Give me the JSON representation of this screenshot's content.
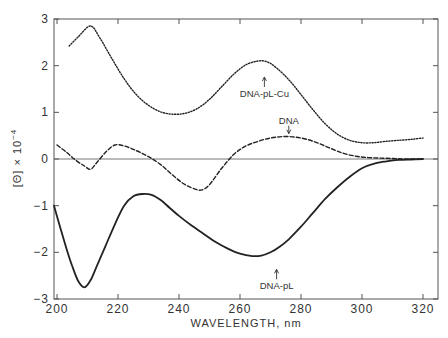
{
  "chart_data": {
    "type": "line",
    "title": "",
    "xlabel": "WAVELENGTH, nm",
    "ylabel": "[Θ] × 10",
    "ylabel_exponent": "−4",
    "xlim": [
      199,
      325
    ],
    "ylim": [
      -3,
      3
    ],
    "x_ticks": [
      200,
      220,
      240,
      260,
      280,
      300,
      320
    ],
    "x_tick_labels": [
      "200",
      "220",
      "240",
      "260",
      "280",
      "300",
      "320"
    ],
    "y_ticks": [
      3,
      2,
      1,
      0,
      -1,
      -2,
      -3
    ],
    "y_tick_labels": [
      "3",
      "2",
      "1",
      "0",
      "−1",
      "−2",
      "−3"
    ],
    "grid": false,
    "zero_line": true,
    "legend": "inline labels",
    "series": [
      {
        "name": "DNA-pL-Cu",
        "style": "dotted",
        "x": [
          204,
          207,
          211,
          214,
          218,
          222,
          226,
          230,
          234,
          238,
          242,
          246,
          250,
          254,
          258,
          262,
          266,
          269,
          272,
          276,
          280,
          284,
          288,
          292,
          296,
          300,
          304,
          308,
          312,
          316,
          320
        ],
        "values": [
          2.42,
          2.62,
          2.85,
          2.6,
          2.15,
          1.72,
          1.38,
          1.15,
          1.01,
          0.96,
          0.98,
          1.08,
          1.28,
          1.55,
          1.82,
          2.02,
          2.1,
          2.08,
          1.95,
          1.7,
          1.38,
          1.05,
          0.75,
          0.53,
          0.4,
          0.35,
          0.35,
          0.38,
          0.4,
          0.42,
          0.45
        ],
        "label_pos": {
          "nm": 268,
          "value": 1.8
        }
      },
      {
        "name": "DNA",
        "style": "dashed",
        "x": [
          200,
          203,
          206,
          209,
          211,
          213,
          216,
          219,
          222,
          226,
          230,
          234,
          238,
          242,
          246,
          248,
          250,
          254,
          258,
          262,
          266,
          270,
          274,
          278,
          282,
          286,
          290,
          294,
          298,
          302,
          306,
          310,
          314,
          320
        ],
        "values": [
          0.3,
          0.15,
          -0.02,
          -0.15,
          -0.22,
          -0.08,
          0.15,
          0.3,
          0.28,
          0.18,
          0.05,
          -0.12,
          -0.35,
          -0.55,
          -0.66,
          -0.65,
          -0.55,
          -0.2,
          0.1,
          0.28,
          0.38,
          0.45,
          0.48,
          0.47,
          0.42,
          0.33,
          0.22,
          0.12,
          0.06,
          0.03,
          0.02,
          0.01,
          0.0,
          0.0
        ],
        "label_pos": {
          "nm": 276,
          "value": 0.5
        }
      },
      {
        "name": "DNA-pL",
        "style": "solid",
        "x": [
          199,
          201,
          203,
          205,
          207,
          209,
          211,
          213,
          216,
          219,
          222,
          225,
          228,
          231,
          234,
          237,
          240,
          244,
          248,
          252,
          256,
          260,
          264,
          267,
          270,
          273,
          276,
          280,
          284,
          288,
          292,
          296,
          300,
          304,
          308,
          312,
          316,
          320
        ],
        "values": [
          -1.0,
          -1.45,
          -1.9,
          -2.3,
          -2.62,
          -2.75,
          -2.6,
          -2.3,
          -1.85,
          -1.4,
          -1.0,
          -0.8,
          -0.75,
          -0.77,
          -0.88,
          -1.05,
          -1.22,
          -1.42,
          -1.6,
          -1.78,
          -1.92,
          -2.03,
          -2.08,
          -2.07,
          -2.0,
          -1.88,
          -1.72,
          -1.45,
          -1.15,
          -0.85,
          -0.6,
          -0.38,
          -0.2,
          -0.1,
          -0.05,
          -0.02,
          -0.01,
          0.0
        ],
        "label_pos": {
          "nm": 272,
          "value": -2.3
        }
      }
    ]
  }
}
